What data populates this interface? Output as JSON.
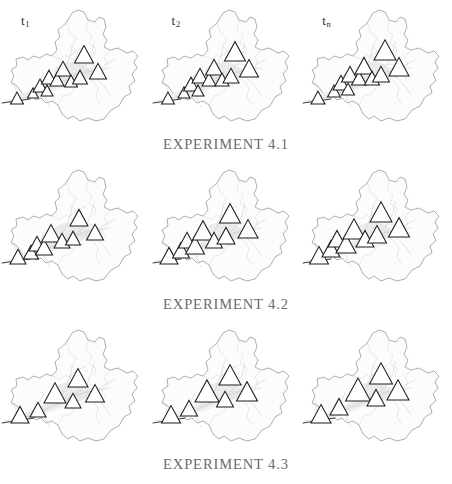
{
  "figure": {
    "grid_rows": 3,
    "grid_cols": 3,
    "background_color": "#ffffff"
  },
  "columns": [
    {
      "id": "t1",
      "label_base": "t",
      "label_sub": "1"
    },
    {
      "id": "t2",
      "label_base": "t",
      "label_sub": "2"
    },
    {
      "id": "tn",
      "label_base": "t",
      "label_sub": "n"
    }
  ],
  "captions": [
    {
      "id": "exp-4-1",
      "text": "EXPERIMENT 4.1"
    },
    {
      "id": "exp-4-2",
      "text": "EXPERIMENT 4.2"
    },
    {
      "id": "exp-4-3",
      "text": "EXPERIMENT 4.3"
    }
  ],
  "colors": {
    "boundary_stroke": "#8d8d8d",
    "boundary_fill": "#fcfcfc",
    "river_stroke": "#c6c6c6",
    "valley_fill": "#e6e6e6",
    "marker_stroke": "#1c1c1c",
    "marker_fill": "#ffffff",
    "axis_line": "#3a3a3a",
    "caption_text": "#6b6b6b",
    "label_text": "#2f2f2f"
  },
  "chart_data": {
    "type": "map",
    "marker_symbol": "triangle",
    "row_labels": [
      "EXPERIMENT 4.1",
      "EXPERIMENT 4.2",
      "EXPERIMENT 4.3"
    ],
    "col_labels": [
      "t1",
      "t2",
      "tn"
    ],
    "panels": [
      {
        "row": "EXPERIMENT 4.1",
        "col": "t1",
        "marker_count": 11,
        "markers": [
          {
            "x": 17,
            "y": 104,
            "size": 13
          },
          {
            "x": 33,
            "y": 98,
            "size": 11
          },
          {
            "x": 40,
            "y": 92,
            "size": 14
          },
          {
            "x": 47,
            "y": 96,
            "size": 12
          },
          {
            "x": 49,
            "y": 84,
            "size": 15
          },
          {
            "x": 57,
            "y": 86,
            "size": 14
          },
          {
            "x": 63,
            "y": 76,
            "size": 16
          },
          {
            "x": 71,
            "y": 87,
            "size": 13
          },
          {
            "x": 80,
            "y": 84,
            "size": 15
          },
          {
            "x": 84,
            "y": 63,
            "size": 19
          },
          {
            "x": 98,
            "y": 79,
            "size": 17
          }
        ]
      },
      {
        "row": "EXPERIMENT 4.1",
        "col": "t2",
        "marker_count": 11,
        "markers": [
          {
            "x": 17,
            "y": 104,
            "size": 13
          },
          {
            "x": 33,
            "y": 98,
            "size": 12
          },
          {
            "x": 40,
            "y": 91,
            "size": 15
          },
          {
            "x": 47,
            "y": 96,
            "size": 12
          },
          {
            "x": 49,
            "y": 83,
            "size": 16
          },
          {
            "x": 58,
            "y": 86,
            "size": 14
          },
          {
            "x": 63,
            "y": 75,
            "size": 17
          },
          {
            "x": 71,
            "y": 86,
            "size": 14
          },
          {
            "x": 80,
            "y": 83,
            "size": 16
          },
          {
            "x": 84,
            "y": 61,
            "size": 21
          },
          {
            "x": 98,
            "y": 77,
            "size": 19
          }
        ]
      },
      {
        "row": "EXPERIMENT 4.1",
        "col": "tn",
        "marker_count": 11,
        "markers": [
          {
            "x": 17,
            "y": 104,
            "size": 14
          },
          {
            "x": 33,
            "y": 97,
            "size": 13
          },
          {
            "x": 40,
            "y": 90,
            "size": 16
          },
          {
            "x": 47,
            "y": 95,
            "size": 13
          },
          {
            "x": 49,
            "y": 82,
            "size": 17
          },
          {
            "x": 58,
            "y": 85,
            "size": 15
          },
          {
            "x": 63,
            "y": 74,
            "size": 18
          },
          {
            "x": 71,
            "y": 85,
            "size": 15
          },
          {
            "x": 80,
            "y": 82,
            "size": 17
          },
          {
            "x": 84,
            "y": 60,
            "size": 22
          },
          {
            "x": 98,
            "y": 76,
            "size": 20
          }
        ]
      },
      {
        "row": "EXPERIMENT 4.2",
        "col": "t1",
        "marker_count": 9,
        "markers": [
          {
            "x": 18,
            "y": 104,
            "size": 16
          },
          {
            "x": 31,
            "y": 99,
            "size": 15
          },
          {
            "x": 37,
            "y": 91,
            "size": 16
          },
          {
            "x": 44,
            "y": 95,
            "size": 17
          },
          {
            "x": 51,
            "y": 82,
            "size": 19
          },
          {
            "x": 62,
            "y": 88,
            "size": 16
          },
          {
            "x": 73,
            "y": 85,
            "size": 15
          },
          {
            "x": 79,
            "y": 66,
            "size": 18
          },
          {
            "x": 95,
            "y": 80,
            "size": 17
          }
        ]
      },
      {
        "row": "EXPERIMENT 4.2",
        "col": "t2",
        "marker_count": 9,
        "markers": [
          {
            "x": 18,
            "y": 104,
            "size": 18
          },
          {
            "x": 30,
            "y": 98,
            "size": 17
          },
          {
            "x": 36,
            "y": 88,
            "size": 17
          },
          {
            "x": 44,
            "y": 94,
            "size": 19
          },
          {
            "x": 52,
            "y": 80,
            "size": 21
          },
          {
            "x": 63,
            "y": 88,
            "size": 17
          },
          {
            "x": 75,
            "y": 84,
            "size": 18
          },
          {
            "x": 79,
            "y": 63,
            "size": 21
          },
          {
            "x": 97,
            "y": 78,
            "size": 20
          }
        ]
      },
      {
        "row": "EXPERIMENT 4.2",
        "col": "tn",
        "marker_count": 9,
        "markers": [
          {
            "x": 18,
            "y": 104,
            "size": 19
          },
          {
            "x": 30,
            "y": 97,
            "size": 18
          },
          {
            "x": 36,
            "y": 87,
            "size": 18
          },
          {
            "x": 45,
            "y": 93,
            "size": 20
          },
          {
            "x": 53,
            "y": 79,
            "size": 22
          },
          {
            "x": 64,
            "y": 87,
            "size": 18
          },
          {
            "x": 76,
            "y": 83,
            "size": 19
          },
          {
            "x": 80,
            "y": 62,
            "size": 22
          },
          {
            "x": 98,
            "y": 77,
            "size": 21
          }
        ]
      },
      {
        "row": "EXPERIMENT 4.3",
        "col": "t1",
        "marker_count": 6,
        "markers": [
          {
            "x": 20,
            "y": 103,
            "size": 18
          },
          {
            "x": 38,
            "y": 97,
            "size": 16
          },
          {
            "x": 55,
            "y": 83,
            "size": 22
          },
          {
            "x": 73,
            "y": 88,
            "size": 16
          },
          {
            "x": 78,
            "y": 67,
            "size": 20
          },
          {
            "x": 95,
            "y": 82,
            "size": 19
          }
        ]
      },
      {
        "row": "EXPERIMENT 4.3",
        "col": "t2",
        "marker_count": 6,
        "markers": [
          {
            "x": 20,
            "y": 103,
            "size": 19
          },
          {
            "x": 38,
            "y": 96,
            "size": 17
          },
          {
            "x": 56,
            "y": 82,
            "size": 24
          },
          {
            "x": 74,
            "y": 87,
            "size": 17
          },
          {
            "x": 79,
            "y": 65,
            "size": 22
          },
          {
            "x": 96,
            "y": 81,
            "size": 21
          }
        ]
      },
      {
        "row": "EXPERIMENT 4.3",
        "col": "tn",
        "marker_count": 6,
        "markers": [
          {
            "x": 20,
            "y": 103,
            "size": 20
          },
          {
            "x": 38,
            "y": 95,
            "size": 18
          },
          {
            "x": 57,
            "y": 81,
            "size": 25
          },
          {
            "x": 75,
            "y": 86,
            "size": 18
          },
          {
            "x": 80,
            "y": 64,
            "size": 23
          },
          {
            "x": 97,
            "y": 80,
            "size": 22
          }
        ]
      }
    ]
  }
}
